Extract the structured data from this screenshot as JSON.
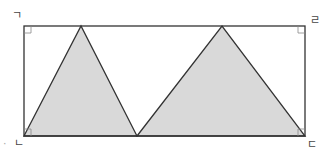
{
  "diagram": {
    "type": "geometry",
    "vertex_labels": {
      "top_left": "ㄱ",
      "top_right": "ㄹ",
      "bottom_left": "ㄴ",
      "bottom_right": "ㄷ"
    },
    "stray_mark": "·",
    "colors": {
      "stroke": "#333333",
      "fill": "#d9d9d9",
      "background": "#ffffff",
      "right_angle_marker": "#888888"
    },
    "rectangle": {
      "x1": 24,
      "y1": 26,
      "x2": 305,
      "y2": 136
    },
    "triangles": [
      {
        "points": [
          [
            24,
            136
          ],
          [
            81,
            26
          ],
          [
            137,
            136
          ]
        ]
      },
      {
        "points": [
          [
            137,
            136
          ],
          [
            222,
            26
          ],
          [
            305,
            136
          ]
        ]
      }
    ],
    "right_angle_markers": [
      "top_left",
      "top_right",
      "bottom_left",
      "bottom_right"
    ]
  }
}
